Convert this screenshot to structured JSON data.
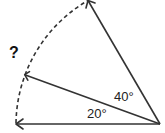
{
  "diagram": {
    "type": "angle-diagram",
    "vertex": {
      "x": 160,
      "y": 124
    },
    "radius": 144,
    "rays": [
      {
        "name": "ray-0deg",
        "angle_deg": 0
      },
      {
        "name": "ray-20deg",
        "angle_deg": 20
      },
      {
        "name": "ray-60deg",
        "angle_deg": 60
      }
    ],
    "angle_labels": [
      {
        "name": "angle-20-label",
        "text": "20°",
        "x": 87,
        "y": 118
      },
      {
        "name": "angle-40-label",
        "text": "40°",
        "x": 114,
        "y": 101
      }
    ],
    "question_mark": {
      "text": "?",
      "x": 9,
      "y": 58
    },
    "colors": {
      "stroke": "#333333",
      "text": "#222222"
    }
  }
}
